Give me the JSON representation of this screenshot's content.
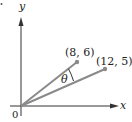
{
  "diagram": {
    "axes": {
      "x_label": "x",
      "y_label": "y",
      "origin_label": "0"
    },
    "points": [
      {
        "label": "(8, 6)",
        "x": 8,
        "y": 6
      },
      {
        "label": "(12, 5)",
        "x": 12,
        "y": 5
      }
    ],
    "angle_label": "θ",
    "colors": {
      "axis": "#333333",
      "vector": "#8a8a8a",
      "point": "#8a8a8a",
      "text": "#222222"
    }
  }
}
